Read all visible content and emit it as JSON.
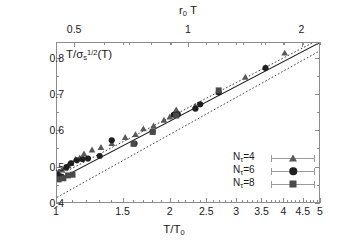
{
  "chart_data": {
    "type": "scatter",
    "title": "",
    "xlabel": "T/T_0",
    "xlabel_top": "r_0 T",
    "ylabel": "T/sigma_s^{1/2}(T)",
    "xscale": "log",
    "yscale": "linear",
    "xlim": [
      1,
      5
    ],
    "ylim": [
      0.4,
      0.843
    ],
    "xlim_top": [
      0.4477,
      2.2386
    ],
    "grid": false,
    "legend_position": "lower right",
    "x_ticks_bottom": [
      "1",
      "1.5",
      "2",
      "2.5",
      "3",
      "3.5",
      "4",
      "4.5",
      "5"
    ],
    "x_tick_values_bottom": [
      1,
      1.5,
      2,
      2.5,
      3,
      3.5,
      4,
      4.5,
      5
    ],
    "x_minor_bottom": [
      1.1,
      1.2,
      1.3,
      1.4,
      1.6,
      1.7,
      1.8,
      1.9,
      2.1,
      2.2,
      2.3,
      2.4,
      2.6,
      2.7,
      2.8,
      2.9,
      3.1,
      3.2,
      3.3,
      3.4,
      3.6,
      3.7,
      3.8,
      3.9,
      4.1,
      4.2,
      4.3,
      4.4,
      4.6,
      4.7,
      4.8,
      4.9
    ],
    "x_ticks_top": [
      "0.5",
      "1",
      "2"
    ],
    "x_tick_values_top": [
      0.5,
      1,
      2
    ],
    "x_minor_top": [
      0.6,
      0.7,
      0.8,
      0.9,
      1.2,
      1.4,
      1.6,
      1.8,
      2.2
    ],
    "y_ticks": [
      "0.4",
      "0.5",
      "0.6",
      "0.7",
      "0.8"
    ],
    "y_tick_values": [
      0.4,
      0.5,
      0.6,
      0.7,
      0.8
    ],
    "y_minor": [
      0.45,
      0.55,
      0.65,
      0.75
    ],
    "series": [
      {
        "name": "N_t=4",
        "legend_label": "Nτ=4",
        "marker": "triangle",
        "color": "#595959",
        "points": [
          {
            "x": 1.01,
            "y": 0.483
          },
          {
            "x": 1.03,
            "y": 0.489
          },
          {
            "x": 1.05,
            "y": 0.494
          },
          {
            "x": 1.07,
            "y": 0.502
          },
          {
            "x": 1.09,
            "y": 0.508
          },
          {
            "x": 1.12,
            "y": 0.519
          },
          {
            "x": 1.15,
            "y": 0.523
          },
          {
            "x": 1.18,
            "y": 0.534
          },
          {
            "x": 1.24,
            "y": 0.545
          },
          {
            "x": 1.31,
            "y": 0.552
          },
          {
            "x": 1.4,
            "y": 0.563
          },
          {
            "x": 1.52,
            "y": 0.58
          },
          {
            "x": 1.62,
            "y": 0.588
          },
          {
            "x": 1.7,
            "y": 0.604
          },
          {
            "x": 1.81,
            "y": 0.612
          },
          {
            "x": 1.93,
            "y": 0.628
          },
          {
            "x": 2.0,
            "y": 0.637
          },
          {
            "x": 2.08,
            "y": 0.657
          },
          {
            "x": 2.34,
            "y": 0.667
          },
          {
            "x": 2.7,
            "y": 0.707
          },
          {
            "x": 3.18,
            "y": 0.748
          },
          {
            "x": 3.6,
            "y": 0.775
          },
          {
            "x": 4.05,
            "y": 0.815
          }
        ]
      },
      {
        "name": "N_t=6",
        "legend_label": "Nτ=6",
        "marker": "circle",
        "color": "#1f1f1f",
        "points": [
          {
            "x": 1.0,
            "y": 0.477
          },
          {
            "x": 1.03,
            "y": 0.47
          },
          {
            "x": 1.06,
            "y": 0.497
          },
          {
            "x": 1.09,
            "y": 0.508
          },
          {
            "x": 1.13,
            "y": 0.516
          },
          {
            "x": 1.17,
            "y": 0.519
          },
          {
            "x": 1.21,
            "y": 0.521
          },
          {
            "x": 1.3,
            "y": 0.528
          },
          {
            "x": 1.4,
            "y": 0.572
          },
          {
            "x": 1.61,
            "y": 0.563
          },
          {
            "x": 1.8,
            "y": 0.596
          },
          {
            "x": 2.05,
            "y": 0.643
          },
          {
            "x": 2.1,
            "y": 0.644
          },
          {
            "x": 2.34,
            "y": 0.66
          },
          {
            "x": 2.41,
            "y": 0.672
          },
          {
            "x": 2.7,
            "y": 0.705
          },
          {
            "x": 3.6,
            "y": 0.773
          }
        ]
      },
      {
        "name": "N_t=8",
        "legend_label": "Nτ=8",
        "marker": "square",
        "color": "#4a4a4a",
        "points": [
          {
            "x": 1.01,
            "y": 0.463
          },
          {
            "x": 1.04,
            "y": 0.466
          },
          {
            "x": 1.07,
            "y": 0.474
          },
          {
            "x": 1.1,
            "y": 0.476
          },
          {
            "x": 1.6,
            "y": 0.562
          },
          {
            "x": 1.8,
            "y": 0.595
          },
          {
            "x": 2.08,
            "y": 0.641
          },
          {
            "x": 2.7,
            "y": 0.711
          }
        ]
      }
    ],
    "fit_lines": [
      {
        "name": "central-fit",
        "style": "solid",
        "color": "#1a1a1a",
        "points": [
          {
            "x": 1.0,
            "y": 0.4605
          },
          {
            "x": 5.0,
            "y": 0.843
          }
        ]
      },
      {
        "name": "upper-band",
        "style": "dotted",
        "color": "#3d3d3d",
        "points": [
          {
            "x": 1.0,
            "y": 0.472
          },
          {
            "x": 5.0,
            "y": 0.853
          }
        ]
      },
      {
        "name": "lower-band",
        "style": "dotted",
        "color": "#3d3d3d",
        "points": [
          {
            "x": 1.0,
            "y": 0.413
          },
          {
            "x": 5.0,
            "y": 0.82
          }
        ]
      }
    ]
  },
  "axes": {
    "bottom_title": "T/T",
    "bottom_title_sub": "0",
    "top_title": "r",
    "top_title_sub": "0",
    "top_title_tail": "T",
    "y_title_lead": "T/σ",
    "y_title_sub": "s",
    "y_title_sup": "1/2",
    "y_title_tail": "(T)"
  },
  "legend": {
    "items": [
      {
        "label_lead": "N",
        "label_sub": "τ",
        "label_tail": "=4",
        "marker": "triangle-icon"
      },
      {
        "label_lead": "N",
        "label_sub": "τ",
        "label_tail": "=6",
        "marker": "circle-icon"
      },
      {
        "label_lead": "N",
        "label_sub": "τ",
        "label_tail": "=8",
        "marker": "square-icon"
      }
    ]
  }
}
